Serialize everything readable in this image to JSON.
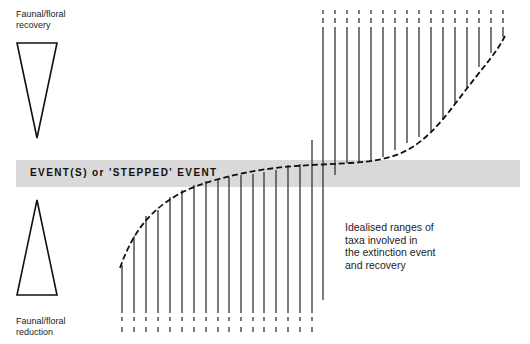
{
  "band": {
    "label": "EVENT(S) or 'STEPPED' EVENT",
    "color": "#d9d9d9"
  },
  "labels": {
    "recovery": [
      "Faunal/floral",
      "recovery"
    ],
    "reduction": [
      "Faunal/floral",
      "reduction"
    ],
    "ranges": [
      "Idealised ranges of",
      "taxa involved in",
      "the extinction event",
      "and recovery"
    ]
  },
  "triangles": {
    "recovery": {
      "points": "17,43 57,43 37,138",
      "direction": "down"
    },
    "reduction": {
      "points": "17,295 57,295 37,200",
      "direction": "up"
    }
  },
  "lower_taxa": [
    {
      "x": 122,
      "top": 265
    },
    {
      "x": 134,
      "top": 236
    },
    {
      "x": 146,
      "top": 216
    },
    {
      "x": 158,
      "top": 210
    },
    {
      "x": 170,
      "top": 197
    },
    {
      "x": 182,
      "top": 190
    },
    {
      "x": 194,
      "top": 185
    },
    {
      "x": 206,
      "top": 181
    },
    {
      "x": 218,
      "top": 179
    },
    {
      "x": 229,
      "top": 177
    },
    {
      "x": 241,
      "top": 175
    },
    {
      "x": 253,
      "top": 174
    },
    {
      "x": 264,
      "top": 172
    },
    {
      "x": 276,
      "top": 170
    },
    {
      "x": 288,
      "top": 165
    },
    {
      "x": 300,
      "top": 164
    },
    {
      "x": 312,
      "top": 140
    }
  ],
  "upper_taxa": [
    {
      "x": 323,
      "bottom": 300
    },
    {
      "x": 335,
      "bottom": 175
    },
    {
      "x": 347,
      "bottom": 163
    },
    {
      "x": 359,
      "bottom": 163
    },
    {
      "x": 371,
      "bottom": 161
    },
    {
      "x": 383,
      "bottom": 157
    },
    {
      "x": 395,
      "bottom": 150
    },
    {
      "x": 407,
      "bottom": 143
    },
    {
      "x": 419,
      "bottom": 137
    },
    {
      "x": 431,
      "bottom": 131
    },
    {
      "x": 443,
      "bottom": 120
    },
    {
      "x": 455,
      "bottom": 104
    },
    {
      "x": 467,
      "bottom": 88
    },
    {
      "x": 479,
      "bottom": 67
    },
    {
      "x": 491,
      "bottom": 53
    },
    {
      "x": 503,
      "bottom": 37
    }
  ],
  "lower_dash_region": {
    "solid_end": 313,
    "dash1": [
      317,
      321
    ],
    "dash2": [
      327,
      332
    ]
  },
  "upper_dash_region": {
    "solid_start": 27,
    "dash1": [
      10,
      14
    ],
    "dash2": [
      18,
      23
    ]
  },
  "curve": {
    "path": "M 120 268 C 135 225, 160 195, 215 180 S 300 166, 350 163 S 420 150, 455 104 S 495 55, 505 36"
  },
  "colors": {
    "line": "#333333",
    "curve": "#111111",
    "triangle": "#111111"
  }
}
